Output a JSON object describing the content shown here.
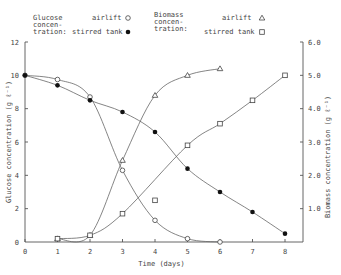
{
  "chart_data": {
    "type": "line",
    "xlabel": "Time (days)",
    "ylabel": "Glucose concentration (g ℓ⁻¹)",
    "y2label": "Biomass concentration (g ℓ⁻¹)",
    "xlim": [
      0,
      8.5
    ],
    "ylim": [
      0,
      12
    ],
    "y2lim": [
      0,
      6.0
    ],
    "xticks": [
      "0",
      "1",
      "2",
      "3",
      "4",
      "5",
      "6",
      "7",
      "8"
    ],
    "yticks": [
      "0",
      "2",
      "4",
      "6",
      "8",
      "10",
      "12"
    ],
    "y2ticks": [
      "1.0",
      "2.0",
      "3.0",
      "4.0",
      "5.0",
      "6.0"
    ],
    "grid": false,
    "legend": {
      "glucose_title": [
        "Glucose",
        "concen-",
        "tration:"
      ],
      "biomass_title": [
        "Biomass",
        "concen-",
        "tration:"
      ],
      "airlift": "airlift",
      "stirred": "stirred tank"
    },
    "series": [
      {
        "name": "Glucose airlift",
        "axis": "left",
        "marker": "open-circle",
        "x": [
          0,
          1,
          2,
          3,
          4,
          5,
          6
        ],
        "values": [
          10.0,
          9.75,
          8.7,
          4.3,
          1.3,
          0.2,
          0.0
        ]
      },
      {
        "name": "Glucose stirred tank",
        "axis": "left",
        "marker": "filled-circle",
        "x": [
          0,
          1,
          2,
          3,
          4,
          5,
          6,
          7,
          8
        ],
        "values": [
          10.0,
          9.4,
          8.5,
          7.8,
          6.6,
          4.4,
          3.0,
          1.8,
          0.5
        ]
      },
      {
        "name": "Biomass airlift",
        "axis": "right",
        "marker": "open-triangle",
        "x": [
          1,
          2,
          3,
          4,
          5,
          6
        ],
        "values": [
          0.1,
          0.2,
          2.45,
          4.4,
          5.0,
          5.2
        ]
      },
      {
        "name": "Biomass stirred tank",
        "axis": "right",
        "marker": "open-square",
        "x": [
          1,
          2,
          3,
          4,
          5,
          6,
          7,
          8
        ],
        "values": [
          0.1,
          0.2,
          0.85,
          1.25,
          2.9,
          3.55,
          4.25,
          5.0
        ]
      }
    ]
  }
}
